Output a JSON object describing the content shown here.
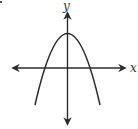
{
  "figure": {
    "type": "function-graph",
    "axes": {
      "x_label": "x",
      "y_label": "y"
    },
    "curve": {
      "kind": "parabola",
      "opens": "down",
      "vertex_on_y_axis": true,
      "vertex_above_x_axis": true,
      "x_intercepts": 2
    },
    "corner_mark": "·"
  },
  "colors": {
    "stroke": "#2b2b2b",
    "background": "#ffffff"
  }
}
